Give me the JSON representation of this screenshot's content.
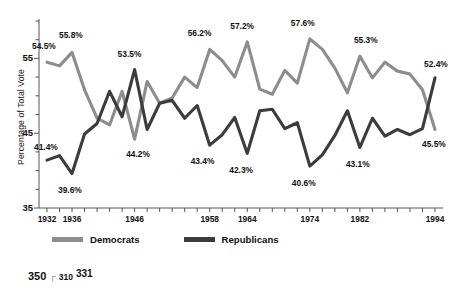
{
  "chart_data": {
    "type": "line",
    "title": "",
    "xlabel": "",
    "ylabel": "Percentage of Total Vote",
    "ylim": [
      35,
      60
    ],
    "yticks": [
      35,
      45,
      55
    ],
    "ytick_labels": [
      "35",
      "45",
      "55"
    ],
    "grid": false,
    "legend_position": "bottom-left",
    "x": [
      1932,
      1934,
      1936,
      1938,
      1940,
      1942,
      1944,
      1946,
      1948,
      1950,
      1952,
      1954,
      1956,
      1958,
      1960,
      1962,
      1964,
      1966,
      1968,
      1970,
      1972,
      1974,
      1976,
      1978,
      1980,
      1982,
      1984,
      1986,
      1988,
      1990,
      1992,
      1994
    ],
    "xtick_labels": [
      "1932",
      "1936",
      "1946",
      "1958",
      "1964",
      "1974",
      "1982",
      "1994"
    ],
    "xtick_values": [
      1932,
      1936,
      1946,
      1958,
      1964,
      1974,
      1982,
      1994
    ],
    "series": [
      {
        "name": "Democrats",
        "color": "#8d8d8d",
        "values": [
          54.5,
          54.0,
          55.8,
          50.8,
          47.0,
          46.1,
          50.6,
          44.2,
          51.9,
          49.0,
          49.7,
          52.5,
          51.1,
          56.2,
          54.7,
          52.5,
          57.2,
          50.9,
          50.2,
          53.4,
          51.7,
          57.6,
          56.2,
          53.7,
          50.4,
          55.3,
          52.4,
          54.5,
          53.3,
          52.9,
          50.8,
          45.5
        ]
      },
      {
        "name": "Republicans",
        "color": "#3c3c3c",
        "values": [
          41.4,
          42.0,
          39.6,
          44.9,
          46.3,
          50.6,
          47.2,
          53.5,
          45.5,
          49.0,
          49.4,
          47.0,
          48.7,
          43.4,
          44.8,
          47.1,
          42.3,
          48.0,
          48.2,
          45.6,
          46.4,
          40.6,
          42.1,
          44.7,
          48.0,
          43.1,
          47.0,
          44.6,
          45.5,
          44.8,
          45.6,
          52.4
        ]
      }
    ],
    "annotations": [
      {
        "text": "54.5%",
        "x": 1932,
        "y": 54.5,
        "series": "Democrats",
        "dx": -6,
        "dy": -16
      },
      {
        "text": "55.8%",
        "x": 1936,
        "y": 55.8,
        "series": "Democrats",
        "dx": -4,
        "dy": -17
      },
      {
        "text": "53.5%",
        "x": 1946,
        "y": 53.5,
        "series": "Republicans",
        "dx": -8,
        "dy": -16
      },
      {
        "text": "56.2%",
        "x": 1958,
        "y": 56.2,
        "series": "Democrats",
        "dx": -13,
        "dy": -16
      },
      {
        "text": "57.2%",
        "x": 1964,
        "y": 57.2,
        "series": "Democrats",
        "dx": -8,
        "dy": -16
      },
      {
        "text": "57.6%",
        "x": 1974,
        "y": 57.6,
        "series": "Democrats",
        "dx": -10,
        "dy": -16
      },
      {
        "text": "55.3%",
        "x": 1982,
        "y": 55.3,
        "series": "Democrats",
        "dx": 3,
        "dy": -16
      },
      {
        "text": "52.4%",
        "x": 1994,
        "y": 52.4,
        "series": "Republicans",
        "dx": -2,
        "dy": -14
      },
      {
        "text": "41.4%",
        "x": 1932,
        "y": 41.4,
        "series": "Republicans",
        "dx": -4,
        "dy": -13
      },
      {
        "text": "39.6%",
        "x": 1936,
        "y": 39.6,
        "series": "Republicans",
        "dx": -5,
        "dy": 16
      },
      {
        "text": "44.2%",
        "x": 1948,
        "y": 44.2,
        "series": "Democrats",
        "dx": -12,
        "dy": 15
      },
      {
        "text": "43.4%",
        "x": 1958,
        "y": 43.4,
        "series": "Republicans",
        "dx": -10,
        "dy": 16
      },
      {
        "text": "42.3%",
        "x": 1964,
        "y": 42.3,
        "series": "Republicans",
        "dx": -9,
        "dy": 17
      },
      {
        "text": "40.6%",
        "x": 1974,
        "y": 40.6,
        "series": "Republicans",
        "dx": -9,
        "dy": 17
      },
      {
        "text": "43.1%",
        "x": 1982,
        "y": 43.1,
        "series": "Republicans",
        "dx": -5,
        "dy": 17
      },
      {
        "text": "45.5%",
        "x": 1994,
        "y": 45.5,
        "series": "Democrats",
        "dx": -4,
        "dy": 15
      }
    ]
  },
  "legend": {
    "entries": [
      {
        "label": "Democrats",
        "color": "#8d8d8d"
      },
      {
        "label": "Republicans",
        "color": "#3c3c3c"
      }
    ]
  },
  "footer_fragment": {
    "value_a": "350",
    "bracket": "┌",
    "value_b": "310",
    "value_c": "331"
  }
}
